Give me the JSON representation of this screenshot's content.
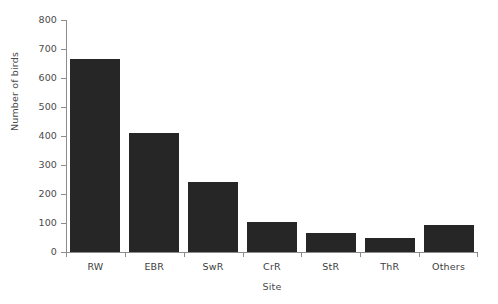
{
  "chart_data": {
    "type": "bar",
    "title": "",
    "xlabel": "Site",
    "ylabel": "Number of birds",
    "categories": [
      "RW",
      "EBR",
      "SwR",
      "CrR",
      "StR",
      "ThR",
      "Others"
    ],
    "values": [
      665,
      410,
      240,
      102,
      65,
      50,
      93
    ],
    "ylim": [
      0,
      800
    ],
    "yticks": [
      0,
      100,
      200,
      300,
      400,
      500,
      600,
      700,
      800
    ],
    "ytick_labels": [
      "0",
      "100",
      "200",
      "300",
      "400",
      "500",
      "600",
      "700",
      "800"
    ],
    "grid": false,
    "legend": null,
    "bar_color": "#262626",
    "axis_color": "#8c8c8c",
    "background": "#ffffff"
  }
}
